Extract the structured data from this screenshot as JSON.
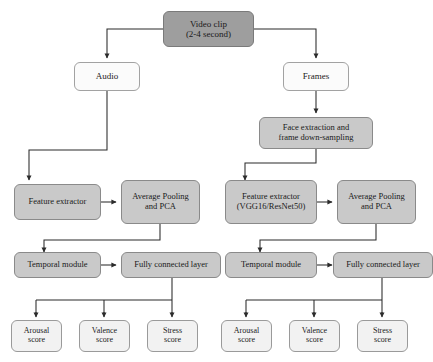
{
  "diagram": {
    "type": "flowchart",
    "colors": {
      "dark_fill": "#9e9e9e",
      "mid_fill": "#c9c9c9",
      "pale_fill": "#f2f2f2",
      "white_fill": "#fbfbfb",
      "stroke": "#8d8d8d",
      "connector": "#2b2b2b",
      "background": "#ffffff"
    },
    "nodes": {
      "video_clip": {
        "line1": "Video clip",
        "line2": "(2-4 second)"
      },
      "audio": {
        "label": "Audio"
      },
      "frames": {
        "label": "Frames"
      },
      "face_extraction": {
        "line1": "Face extraction and",
        "line2": "frame down-sampling"
      },
      "audio_feature_extractor": {
        "label": "Feature extractor"
      },
      "audio_avg_pool": {
        "line1": "Average Pooling",
        "line2": "and PCA"
      },
      "audio_temporal_module": {
        "label": "Temporal module"
      },
      "audio_fully_connected": {
        "label": "Fully connected layer"
      },
      "video_feature_extractor": {
        "line1": "Feature extractor",
        "line2": "(VGG16/ResNet50)"
      },
      "video_avg_pool": {
        "line1": "Average Pooling",
        "line2": "and PCA"
      },
      "video_temporal_module": {
        "label": "Temporal module"
      },
      "video_fully_connected": {
        "label": "Fully connected layer"
      },
      "audio_arousal": {
        "line1": "Arousal",
        "line2": "score"
      },
      "audio_valence": {
        "line1": "Valence",
        "line2": "score"
      },
      "audio_stress": {
        "line1": "Stress",
        "line2": "score"
      },
      "video_arousal": {
        "line1": "Arousal",
        "line2": "score"
      },
      "video_valence": {
        "line1": "Valence",
        "line2": "score"
      },
      "video_stress": {
        "line1": "Stress",
        "line2": "score"
      }
    }
  }
}
